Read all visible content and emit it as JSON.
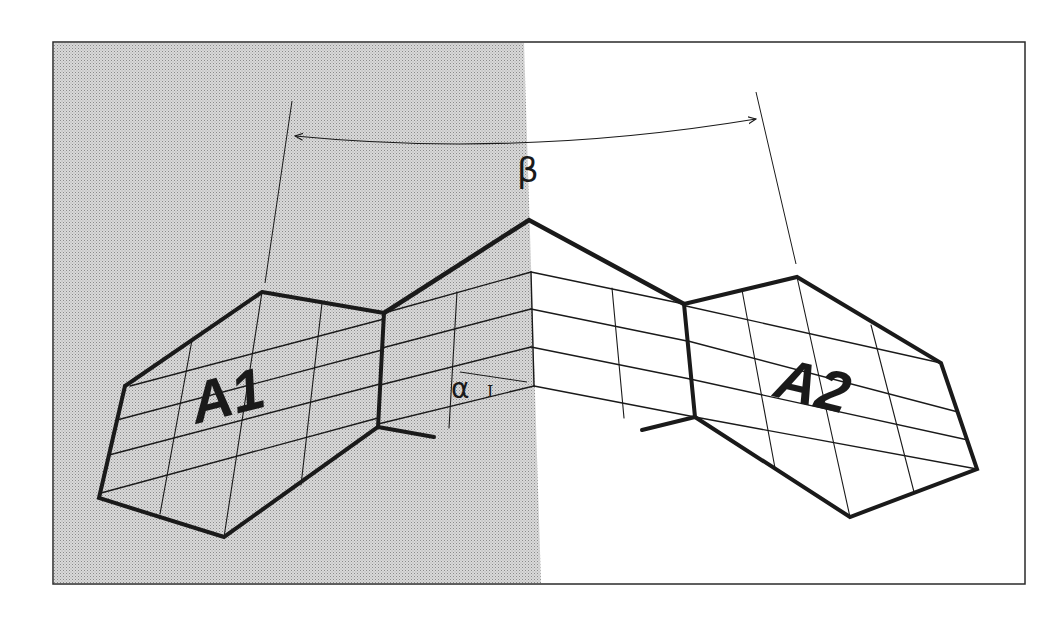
{
  "figure": {
    "type": "geometric-diagram",
    "colors": {
      "background": "#ffffff",
      "shade": "#cfcfcf",
      "ink": "#1a1a1a",
      "frame": "#2a2a2a"
    },
    "frame": {
      "x": 53,
      "y": 42,
      "width": 972,
      "height": 542
    },
    "shaded_region": {
      "points": [
        [
          54,
          43
        ],
        [
          524,
          43
        ],
        [
          541,
          583
        ],
        [
          54,
          583
        ]
      ]
    },
    "labels": {
      "region_left": {
        "text": "A1",
        "x": 196,
        "y": 424,
        "size": 58,
        "rotate": -14
      },
      "region_right": {
        "text": "A2",
        "x": 772,
        "y": 396,
        "size": 58,
        "rotate": 14
      },
      "beta": {
        "text": "β",
        "x": 517,
        "y": 182,
        "size": 34
      },
      "alpha": {
        "text": "α",
        "x": 451,
        "y": 398,
        "size": 28
      },
      "alpha_sub": {
        "text": "I",
        "x": 487,
        "y": 397,
        "size": 16
      }
    },
    "beta_arc": {
      "path": "M 295 136 Q 520 158 756 119",
      "left_normal": [
        [
          292,
          101
        ],
        [
          265,
          283
        ]
      ],
      "right_normal": [
        [
          756,
          92
        ],
        [
          796,
          264
        ]
      ]
    },
    "alpha_tick": [
      [
        460,
        372
      ],
      [
        527,
        382
      ]
    ],
    "hexagon_left": {
      "outline": [
        [
          262,
          292
        ],
        [
          384,
          313
        ],
        [
          378,
          427
        ],
        [
          224,
          537
        ],
        [
          99,
          498
        ],
        [
          125,
          386
        ]
      ],
      "grid_rows": [
        [
          [
            130,
            386
          ],
          [
            384,
            319
          ]
        ],
        [
          [
            117,
            420
          ],
          [
            382,
            350
          ]
        ],
        [
          [
            109,
            455
          ],
          [
            380,
            384
          ]
        ],
        [
          [
            101,
            493
          ],
          [
            378,
            418
          ]
        ]
      ],
      "grid_cols": [
        [
          [
            262,
            292
          ],
          [
            224,
            537
          ]
        ],
        [
          [
            322,
            303
          ],
          [
            301,
            485
          ]
        ],
        [
          [
            192,
            340
          ],
          [
            160,
            514
          ]
        ]
      ]
    },
    "central_strip": {
      "roof": [
        [
          384,
          313
        ],
        [
          529,
          220
        ],
        [
          684,
          304
        ]
      ],
      "spine": [
        [
          531,
          272
        ],
        [
          534,
          386
        ]
      ],
      "rows_left": [
        [
          [
            384,
            313
          ],
          [
            531,
            272
          ]
        ],
        [
          [
            382,
            348
          ],
          [
            531,
            309
          ]
        ],
        [
          [
            380,
            385
          ],
          [
            531,
            347
          ]
        ],
        [
          [
            378,
            424
          ],
          [
            534,
            386
          ]
        ]
      ],
      "rows_right": [
        [
          [
            531,
            272
          ],
          [
            684,
            304
          ]
        ],
        [
          [
            531,
            309
          ],
          [
            687,
            341
          ]
        ],
        [
          [
            531,
            347
          ],
          [
            690,
            379
          ]
        ],
        [
          [
            534,
            386
          ],
          [
            695,
            417
          ]
        ]
      ],
      "cols": [
        [
          [
            457,
            292
          ],
          [
            449,
            428
          ]
        ],
        [
          [
            612,
            288
          ],
          [
            624,
            418
          ]
        ]
      ]
    },
    "hexagon_right": {
      "outline": [
        [
          684,
          304
        ],
        [
          797,
          277
        ],
        [
          941,
          363
        ],
        [
          977,
          469
        ],
        [
          850,
          517
        ],
        [
          695,
          417
        ]
      ],
      "grid_rows": [
        [
          [
            686,
            306
          ],
          [
            941,
            363
          ]
        ],
        [
          [
            688,
            341
          ],
          [
            958,
            412
          ]
        ],
        [
          [
            690,
            379
          ],
          [
            968,
            440
          ]
        ],
        [
          [
            695,
            417
          ],
          [
            977,
            469
          ]
        ]
      ],
      "grid_cols": [
        [
          [
            797,
            277
          ],
          [
            850,
            517
          ]
        ],
        [
          [
            742,
            290
          ],
          [
            775,
            468
          ]
        ],
        [
          [
            871,
            325
          ],
          [
            914,
            492
          ]
        ]
      ]
    },
    "stubs": [
      [
        [
          378,
          427
        ],
        [
          434,
          437
        ]
      ],
      [
        [
          695,
          417
        ],
        [
          642,
          430
        ]
      ]
    ]
  }
}
